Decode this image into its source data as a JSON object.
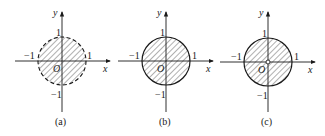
{
  "figures": [
    {
      "id": "a",
      "caption": "(a)",
      "origin": [
        62,
        61
      ],
      "radius": 24,
      "boundary": "dashed",
      "origin_marker": "none",
      "labels": {
        "x": "x",
        "y": "y",
        "o": "O",
        "pos1": "1",
        "neg1": "−1",
        "ypos1": "1",
        "yneg1": "−1"
      }
    },
    {
      "id": "b",
      "caption": "(b)",
      "origin": [
        166,
        61
      ],
      "radius": 24,
      "boundary": "solid",
      "origin_marker": "none",
      "labels": {
        "x": "x",
        "y": "y",
        "o": "O",
        "pos1": "1",
        "neg1": "−1",
        "ypos1": "1",
        "yneg1": "−1"
      }
    },
    {
      "id": "c",
      "caption": "(c)",
      "origin": [
        268,
        62
      ],
      "radius": 24,
      "boundary": "solid",
      "origin_marker": "hollow-point",
      "labels": {
        "x": "x",
        "y": "y",
        "o": "O",
        "pos1": "1",
        "neg1": "−1",
        "ypos1": "1",
        "yneg1": "−1"
      }
    }
  ],
  "colors": {
    "ink": "#1a1a1a",
    "hatch": "#3a3a3a",
    "background": "#ffffff"
  }
}
